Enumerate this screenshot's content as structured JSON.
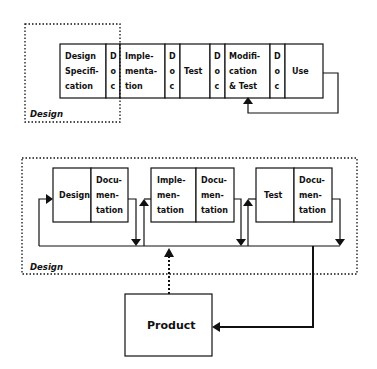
{
  "diagram": {
    "top_model": {
      "group_label": "Design",
      "phases": [
        {
          "id": "design-spec",
          "lines": [
            "Design",
            "Specifi-",
            "cation"
          ]
        },
        {
          "id": "doc1",
          "lines": [
            "D",
            "o",
            "c"
          ]
        },
        {
          "id": "implementation",
          "lines": [
            "Imple-",
            "menta-",
            "tion"
          ]
        },
        {
          "id": "doc2",
          "lines": [
            "D",
            "o",
            "c"
          ]
        },
        {
          "id": "test",
          "lines": [
            "Test"
          ]
        },
        {
          "id": "doc3",
          "lines": [
            "D",
            "o",
            "c"
          ]
        },
        {
          "id": "modification",
          "lines": [
            "Modifi-",
            "cation",
            "& Test"
          ]
        },
        {
          "id": "doc4",
          "lines": [
            "D",
            "o",
            "c"
          ]
        },
        {
          "id": "use",
          "lines": [
            "Use"
          ]
        }
      ],
      "feedback": "Use -> Modification & Test"
    },
    "bottom_model": {
      "group_label": "Design",
      "stages": [
        {
          "id": "design",
          "main": [
            "Design"
          ],
          "doc": [
            "Docu-",
            "men-",
            "tation"
          ]
        },
        {
          "id": "implementation",
          "main": [
            "Imple-",
            "men-",
            "tation"
          ],
          "doc": [
            "Docu-",
            "men-",
            "tation"
          ]
        },
        {
          "id": "test",
          "main": [
            "Test"
          ],
          "doc": [
            "Docu-",
            "men-",
            "tation"
          ]
        }
      ],
      "output_box": "Product"
    }
  }
}
